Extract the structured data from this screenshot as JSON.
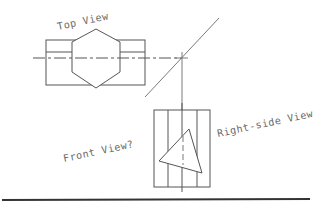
{
  "diagram": {
    "type": "orthographic-projection-exercise",
    "labels": {
      "top_view": "Top View",
      "front_view": "Front View?",
      "right_side_view": "Right-side View"
    },
    "colors": {
      "line": "#555555",
      "text": "#6a6a6a",
      "baseline": "#333333",
      "background": "#ffffff"
    }
  }
}
